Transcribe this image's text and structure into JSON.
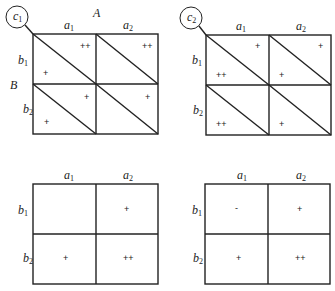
{
  "diagram": {
    "factor_a_label": "A",
    "factor_b_label": "B",
    "panels": [
      {
        "id": "top-left",
        "circle_label": {
          "base": "c",
          "sub": "1"
        },
        "columns": [
          {
            "base": "a",
            "sub": "1"
          },
          {
            "base": "a",
            "sub": "2"
          }
        ],
        "rows": [
          {
            "base": "b",
            "sub": "1"
          },
          {
            "base": "b",
            "sub": "2"
          }
        ],
        "diagonals": true,
        "cells": {
          "b1_a1": {
            "upper": "++",
            "lower": "+"
          },
          "b1_a2": {
            "upper": "++",
            "lower": ""
          },
          "b2_a1": {
            "upper": "+",
            "lower": "+"
          },
          "b2_a2": {
            "upper": "+",
            "lower": ""
          }
        }
      },
      {
        "id": "top-right",
        "circle_label": {
          "base": "c",
          "sub": "2"
        },
        "columns": [
          {
            "base": "a",
            "sub": "1"
          },
          {
            "base": "a",
            "sub": "2"
          }
        ],
        "rows": [
          {
            "base": "b",
            "sub": "1"
          },
          {
            "base": "b",
            "sub": "2"
          }
        ],
        "diagonals": true,
        "cells": {
          "b1_a1": {
            "upper": "+",
            "lower": "++"
          },
          "b1_a2": {
            "upper": "+",
            "lower": "+"
          },
          "b2_a1": {
            "upper": "",
            "lower": "++"
          },
          "b2_a2": {
            "upper": "",
            "lower": "+"
          }
        }
      },
      {
        "id": "bottom-left",
        "columns": [
          {
            "base": "a",
            "sub": "1"
          },
          {
            "base": "a",
            "sub": "2"
          }
        ],
        "rows": [
          {
            "base": "b",
            "sub": "1"
          },
          {
            "base": "b",
            "sub": "2"
          }
        ],
        "diagonals": false,
        "cells": {
          "b1_a1": "",
          "b1_a2": "+",
          "b2_a1": "+",
          "b2_a2": "++"
        }
      },
      {
        "id": "bottom-right",
        "columns": [
          {
            "base": "a",
            "sub": "1"
          },
          {
            "base": "a",
            "sub": "2"
          }
        ],
        "rows": [
          {
            "base": "b",
            "sub": "1"
          },
          {
            "base": "b",
            "sub": "2"
          }
        ],
        "diagonals": false,
        "cells": {
          "b1_a1": "-",
          "b1_a2": "+",
          "b2_a1": "+",
          "b2_a2": "++"
        }
      }
    ]
  }
}
